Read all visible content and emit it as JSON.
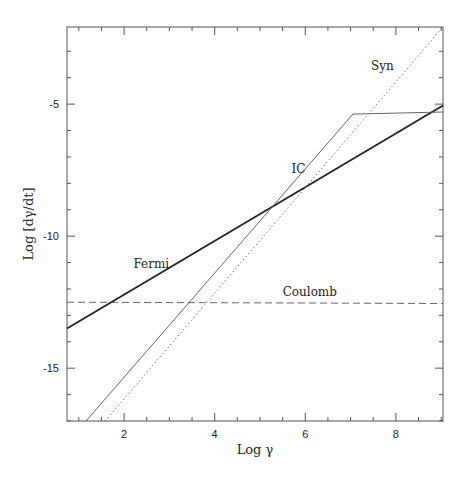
{
  "chart_data": {
    "type": "line",
    "title": "",
    "xlabel": "Log γ",
    "ylabel": "Log [dγ/dt]",
    "xlim": [
      0.74,
      9.04
    ],
    "ylim": [
      -17.0,
      -2.08
    ],
    "grid": false,
    "legend": "inline labels",
    "x_ticks": [
      2,
      4,
      6,
      8
    ],
    "x_minor_step": 0.5,
    "y_ticks": [
      -5,
      -10,
      -15
    ],
    "y_minor_step": 1.0,
    "series": [
      {
        "name": "Fermi",
        "style": "solid-thick",
        "color": "#222222",
        "points": [
          [
            0.74,
            -13.5
          ],
          [
            9.04,
            -5.05
          ]
        ],
        "label_pos": [
          2.6,
          -11.2
        ]
      },
      {
        "name": "IC",
        "style": "solid-thin",
        "color": "#555555",
        "points": [
          [
            1.16,
            -17.0
          ],
          [
            7.05,
            -5.38
          ],
          [
            9.04,
            -5.3
          ]
        ],
        "label_pos": [
          5.85,
          -7.6
        ]
      },
      {
        "name": "Syn",
        "style": "dotted",
        "color": "#777777",
        "points": [
          [
            1.58,
            -17.0
          ],
          [
            9.04,
            -2.08
          ]
        ],
        "label_pos": [
          7.7,
          -3.7
        ]
      },
      {
        "name": "Coulomb",
        "style": "dashed",
        "color": "#555555",
        "points": [
          [
            0.74,
            -12.5
          ],
          [
            9.04,
            -12.55
          ]
        ],
        "label_pos": [
          6.1,
          -12.25
        ]
      }
    ]
  }
}
